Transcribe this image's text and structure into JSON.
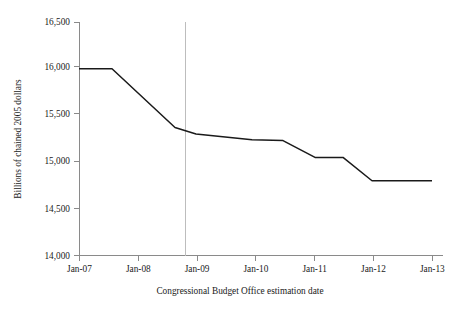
{
  "chart_data": {
    "type": "line",
    "title": "",
    "subtitle": "",
    "xlabel": "Congressional Budget Office estimation date",
    "ylabel": "Billions of chained 2005 dollars",
    "x_tick_labels": [
      "Jan-07",
      "Jan-08",
      "Jan-09",
      "Jan-10",
      "Jan-11",
      "Jan-12",
      "Jan-13"
    ],
    "y_tick_labels": [
      "14,000",
      "14,500",
      "15,000",
      "15,500",
      "16,000",
      "16,500"
    ],
    "y_tick_values": [
      14000,
      14500,
      15000,
      15500,
      16000,
      16500
    ],
    "ylim": [
      14000,
      16500
    ],
    "xlim": [
      "Jan-07",
      "Jan-13"
    ],
    "grid": false,
    "legend": "none",
    "annotations": [
      {
        "name": "jan-09-reference-line",
        "type": "vline",
        "x": "Jan-09",
        "color": "#bdbdbd"
      }
    ],
    "series": [
      {
        "name": "CBO potential GDP estimate",
        "color": "#1a1a1a",
        "x": [
          "Jan-07",
          "Jan-07.6",
          "Jan-09",
          "Jan-09.6",
          "Jan-10.5",
          "Jan-11.0",
          "Jan-11.6",
          "Jan-12.0",
          "Jan-13"
        ],
        "values": [
          16000,
          16000,
          15370,
          15290,
          15230,
          15220,
          15050,
          14800,
          14800
        ]
      }
    ],
    "points": [
      {
        "x_px": 79,
        "value": 16000
      },
      {
        "x_px": 112,
        "value": 16000
      },
      {
        "x_px": 175,
        "value": 15370
      },
      {
        "x_px": 196,
        "value": 15300
      },
      {
        "x_px": 252,
        "value": 15240
      },
      {
        "x_px": 283,
        "value": 15230
      },
      {
        "x_px": 315,
        "value": 15050
      },
      {
        "x_px": 343,
        "value": 15050
      },
      {
        "x_px": 372,
        "value": 14800
      },
      {
        "x_px": 432,
        "value": 14800
      }
    ]
  },
  "colors": {
    "line": "#1a1a1a",
    "axis": "#8a8a8a",
    "reference": "#bdbdbd",
    "background": "#ffffff"
  }
}
